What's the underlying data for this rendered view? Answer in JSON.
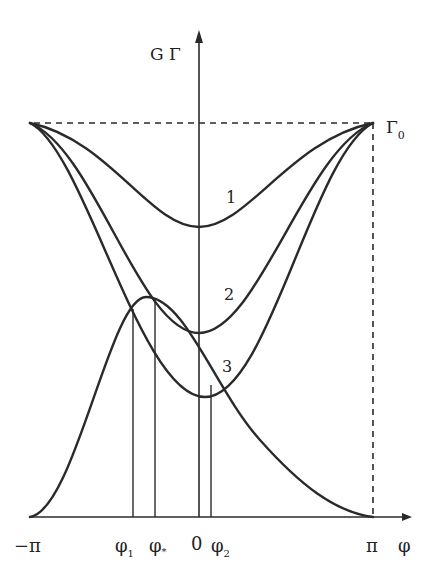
{
  "diagram": {
    "y_axis_label": "G Γ",
    "x_axis_label": "φ",
    "top_level_label": "Γ",
    "top_level_subscript": "0",
    "x_ticks": [
      {
        "label": "−π",
        "sub": ""
      },
      {
        "label": "φ",
        "sub": "1"
      },
      {
        "label": "φ",
        "sub": "*"
      },
      {
        "label": "0",
        "sub": ""
      },
      {
        "label": "φ",
        "sub": "2"
      },
      {
        "label": "π",
        "sub": ""
      }
    ],
    "curve_labels": [
      "1",
      "2",
      "3"
    ],
    "colors": {
      "ink": "#2a2a2a",
      "background": "#ffffff"
    }
  }
}
